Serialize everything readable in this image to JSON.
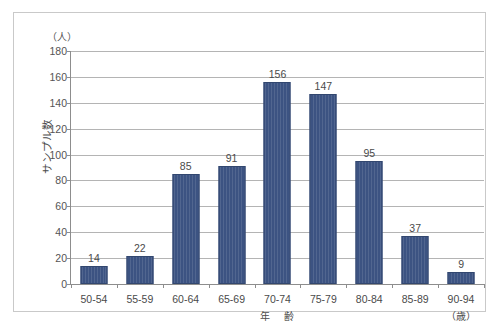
{
  "chart_data": {
    "type": "bar",
    "title": "",
    "subtitle": "",
    "xlabel": "年　齢",
    "xlabel_unit": "（歳）",
    "ylabel": "サンプル数",
    "ylabel_unit": "（人）",
    "categories": [
      "50-54",
      "55-59",
      "60-64",
      "65-69",
      "70-74",
      "75-79",
      "80-84",
      "85-89",
      "90-94"
    ],
    "values": [
      14,
      22,
      85,
      91,
      156,
      147,
      95,
      37,
      9
    ],
    "ylim": [
      0,
      180
    ],
    "ytick_step": 20,
    "yticks": [
      0,
      20,
      40,
      60,
      80,
      100,
      120,
      140,
      160,
      180
    ],
    "ytick_labels": [
      "0",
      "20",
      "40",
      "60",
      "80",
      "100",
      "120",
      "140",
      "160",
      "180"
    ],
    "grid": true,
    "grid_axis": "y",
    "legend": false,
    "bar_color": "#3c5382",
    "grid_color": "#b4b4b4",
    "axis_color": "#8d8d8d",
    "background_color": "#ffffff",
    "data_labels": [
      "14",
      "22",
      "85",
      "91",
      "156",
      "147",
      "95",
      "37",
      "9"
    ]
  }
}
